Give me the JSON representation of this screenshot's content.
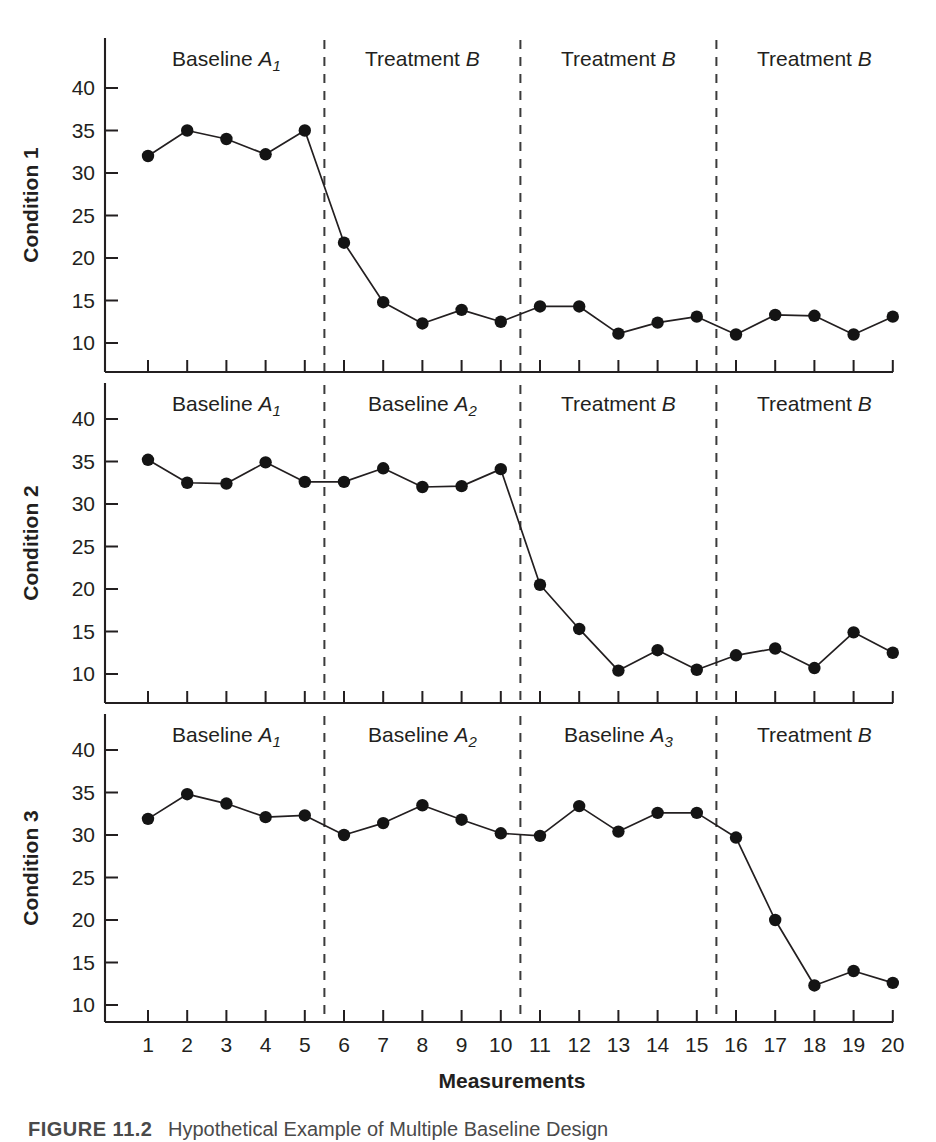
{
  "figure": {
    "xlabel": "Measurements",
    "caption_prefix": "FIGURE 11.2",
    "caption_text": "Hypothetical Example of Multiple Baseline Design"
  },
  "chart_data": {
    "type": "line",
    "title": "Hypothetical Example of Multiple Baseline Design",
    "xlabel": "Measurements",
    "ylabel": "",
    "xlim": [
      0.3,
      20.7
    ],
    "ylim": [
      7.5,
      43
    ],
    "grid": false,
    "legend": "none",
    "x": [
      1,
      2,
      3,
      4,
      5,
      6,
      7,
      8,
      9,
      10,
      11,
      12,
      13,
      14,
      15,
      16,
      17,
      18,
      19,
      20
    ],
    "xticklabels": [
      "1",
      "2",
      "3",
      "4",
      "5",
      "6",
      "7",
      "8",
      "9",
      "10",
      "11",
      "12",
      "13",
      "14",
      "15",
      "16",
      "17",
      "18",
      "19",
      "20"
    ],
    "yticks": [
      10,
      15,
      20,
      25,
      30,
      35,
      40
    ],
    "yticklabels": [
      "10",
      "15",
      "20",
      "25",
      "30",
      "35",
      "40"
    ],
    "panels": [
      {
        "ylabel": "Condition 1",
        "phases": [
          {
            "label": "Baseline",
            "sub": "A",
            "subscript": "1",
            "italic": "A₁",
            "start": 0.5,
            "end": 5.5
          },
          {
            "label": "Treatment",
            "sub": "B",
            "subscript": "",
            "italic": "B",
            "start": 5.5,
            "end": 10.5
          },
          {
            "label": "Treatment",
            "sub": "B",
            "subscript": "",
            "italic": "B",
            "start": 10.5,
            "end": 15.5
          },
          {
            "label": "Treatment",
            "sub": "B",
            "subscript": "",
            "italic": "B",
            "start": 15.5,
            "end": 20.5
          }
        ],
        "phase_lines": [
          5.5,
          10.5,
          15.5
        ],
        "values": [
          32.0,
          35.0,
          34.0,
          32.2,
          35.0,
          21.8,
          14.8,
          12.3,
          13.9,
          12.5,
          14.3,
          14.3,
          11.1,
          12.4,
          13.1,
          11.0,
          13.3,
          13.2,
          11.0,
          13.1
        ]
      },
      {
        "ylabel": "Condition 2",
        "phases": [
          {
            "label": "Baseline",
            "sub": "A",
            "subscript": "1",
            "italic": "A₁",
            "start": 0.5,
            "end": 5.5
          },
          {
            "label": "Baseline",
            "sub": "A",
            "subscript": "2",
            "italic": "A₂",
            "start": 5.5,
            "end": 10.5
          },
          {
            "label": "Treatment",
            "sub": "B",
            "subscript": "",
            "italic": "B",
            "start": 10.5,
            "end": 15.5
          },
          {
            "label": "Treatment",
            "sub": "B",
            "subscript": "",
            "italic": "B",
            "start": 15.5,
            "end": 20.5
          }
        ],
        "phase_lines": [
          5.5,
          10.5,
          15.5
        ],
        "values": [
          35.2,
          32.5,
          32.4,
          34.9,
          32.6,
          32.6,
          34.2,
          32.0,
          32.1,
          34.1,
          20.5,
          15.3,
          10.4,
          12.8,
          10.5,
          12.2,
          13.0,
          10.7,
          14.9,
          12.5
        ]
      },
      {
        "ylabel": "Condition 3",
        "phases": [
          {
            "label": "Baseline",
            "sub": "A",
            "subscript": "1",
            "italic": "A₁",
            "start": 0.5,
            "end": 5.5
          },
          {
            "label": "Baseline",
            "sub": "A",
            "subscript": "2",
            "italic": "A₂",
            "start": 5.5,
            "end": 10.5
          },
          {
            "label": "Baseline",
            "sub": "A",
            "subscript": "3",
            "italic": "A₃",
            "start": 10.5,
            "end": 15.5
          },
          {
            "label": "Treatment",
            "sub": "B",
            "subscript": "",
            "italic": "B",
            "start": 15.5,
            "end": 20.5
          }
        ],
        "phase_lines": [
          5.5,
          10.5,
          15.5
        ],
        "values": [
          31.9,
          34.8,
          33.7,
          32.1,
          32.3,
          30.0,
          31.4,
          33.5,
          31.8,
          30.2,
          29.9,
          33.4,
          30.4,
          32.6,
          32.6,
          29.7,
          20.0,
          12.3,
          14.0,
          12.6
        ]
      }
    ]
  },
  "colors": {
    "ink": "#231f20",
    "dot": "#141414",
    "phase_line": "#3b3b3b",
    "caption": "#4a4a4a"
  }
}
